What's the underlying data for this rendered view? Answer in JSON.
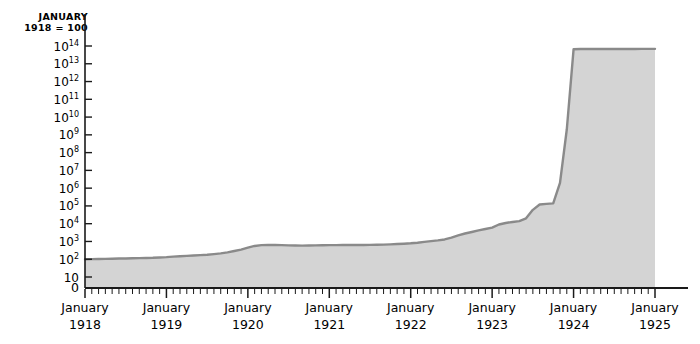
{
  "header": {
    "line1": "JANUARY",
    "line2": "1918 = 100"
  },
  "axes": {
    "zero_label": "0",
    "y_tick_labels": [
      {
        "base": "10",
        "exp": "14"
      },
      {
        "base": "10",
        "exp": "13"
      },
      {
        "base": "10",
        "exp": "12"
      },
      {
        "base": "10",
        "exp": "11"
      },
      {
        "base": "10",
        "exp": "10"
      },
      {
        "base": "10",
        "exp": "9"
      },
      {
        "base": "10",
        "exp": "8"
      },
      {
        "base": "10",
        "exp": "7"
      },
      {
        "base": "10",
        "exp": "6"
      },
      {
        "base": "10",
        "exp": "5"
      },
      {
        "base": "10",
        "exp": "4"
      },
      {
        "base": "10",
        "exp": "3"
      },
      {
        "base": "10",
        "exp": "2"
      },
      {
        "base": "10",
        "exp": ""
      }
    ],
    "x_tick_labels": [
      {
        "month": "January",
        "year": "1918"
      },
      {
        "month": "January",
        "year": "1919"
      },
      {
        "month": "January",
        "year": "1920"
      },
      {
        "month": "January",
        "year": "1921"
      },
      {
        "month": "January",
        "year": "1922"
      },
      {
        "month": "January",
        "year": "1923"
      },
      {
        "month": "January",
        "year": "1924"
      },
      {
        "month": "January",
        "year": "1925"
      }
    ]
  },
  "colors": {
    "background": "#ffffff",
    "area_fill": "#d4d4d4",
    "line": "#8a8a8a",
    "axis": "#1a1a1a",
    "text": "#1a1a1a"
  },
  "chart_data": {
    "type": "area",
    "title": "",
    "subtitle": "",
    "xlabel": "",
    "ylabel": "JANUARY 1918 = 100",
    "yscale": "log",
    "ylim": [
      10,
      100000000000000
    ],
    "grid": false,
    "legend": false,
    "y_ticks": [
      10,
      100,
      1000,
      10000,
      100000,
      1000000,
      10000000,
      100000000,
      1000000000,
      10000000000,
      100000000000,
      1000000000000,
      10000000000000,
      100000000000000
    ],
    "x_ticks": [
      "January 1918",
      "January 1919",
      "January 1920",
      "January 1921",
      "January 1922",
      "January 1923",
      "January 1924",
      "January 1925"
    ],
    "x_minor_ticks": "monthly",
    "x": [
      "1918-01",
      "1918-02",
      "1918-03",
      "1918-04",
      "1918-05",
      "1918-06",
      "1918-07",
      "1918-08",
      "1918-09",
      "1918-10",
      "1918-11",
      "1918-12",
      "1919-01",
      "1919-02",
      "1919-03",
      "1919-04",
      "1919-05",
      "1919-06",
      "1919-07",
      "1919-08",
      "1919-09",
      "1919-10",
      "1919-11",
      "1919-12",
      "1920-01",
      "1920-02",
      "1920-03",
      "1920-04",
      "1920-05",
      "1920-06",
      "1920-07",
      "1920-08",
      "1920-09",
      "1920-10",
      "1920-11",
      "1920-12",
      "1921-01",
      "1921-02",
      "1921-03",
      "1921-04",
      "1921-05",
      "1921-06",
      "1921-07",
      "1921-08",
      "1921-09",
      "1921-10",
      "1921-11",
      "1921-12",
      "1922-01",
      "1922-02",
      "1922-03",
      "1922-04",
      "1922-05",
      "1922-06",
      "1922-07",
      "1922-08",
      "1922-09",
      "1922-10",
      "1922-11",
      "1922-12",
      "1923-01",
      "1923-02",
      "1923-03",
      "1923-04",
      "1923-05",
      "1923-06",
      "1923-07",
      "1923-08",
      "1923-09",
      "1923-10",
      "1923-11",
      "1923-12",
      "1924-01",
      "1924-02",
      "1924-03",
      "1924-04",
      "1924-05",
      "1924-06",
      "1924-07",
      "1924-08",
      "1924-09",
      "1924-10",
      "1924-11",
      "1924-12",
      "1925-01"
    ],
    "values": [
      100,
      101,
      103,
      105,
      107,
      109,
      111,
      113,
      116,
      118,
      120,
      125,
      131,
      140,
      148,
      155,
      163,
      170,
      180,
      195,
      215,
      245,
      290,
      350,
      450,
      560,
      620,
      640,
      630,
      620,
      600,
      590,
      585,
      590,
      600,
      610,
      620,
      625,
      630,
      630,
      632,
      635,
      640,
      650,
      665,
      690,
      720,
      750,
      790,
      850,
      950,
      1050,
      1150,
      1300,
      1650,
      2200,
      2800,
      3400,
      4200,
      5000,
      6000,
      9000,
      11000,
      12500,
      14000,
      20000,
      60000,
      120000,
      130000,
      140000,
      2000000,
      2000000000,
      65000000000000,
      68000000000000,
      68000000000000,
      67500000000000,
      67500000000000,
      67500000000000,
      67500000000000,
      68000000000000,
      68000000000000,
      68000000000000,
      68500000000000,
      69000000000000,
      69000000000000
    ],
    "series": [
      {
        "name": "German price index (January 1918 = 100)",
        "values": [
          100,
          101,
          103,
          105,
          107,
          109,
          111,
          113,
          116,
          118,
          120,
          125,
          131,
          140,
          148,
          155,
          163,
          170,
          180,
          195,
          215,
          245,
          290,
          350,
          450,
          560,
          620,
          640,
          630,
          620,
          600,
          590,
          585,
          590,
          600,
          610,
          620,
          625,
          630,
          630,
          632,
          635,
          640,
          650,
          665,
          690,
          720,
          750,
          790,
          850,
          950,
          1050,
          1150,
          1300,
          1650,
          2200,
          2800,
          3400,
          4200,
          5000,
          6000,
          9000,
          11000,
          12500,
          14000,
          20000,
          60000,
          120000,
          130000,
          140000,
          2000000,
          2000000000,
          65000000000000,
          68000000000000,
          68000000000000,
          67500000000000,
          67500000000000,
          67500000000000,
          67500000000000,
          68000000000000,
          68000000000000,
          68000000000000,
          68500000000000,
          69000000000000,
          69000000000000
        ]
      }
    ]
  }
}
